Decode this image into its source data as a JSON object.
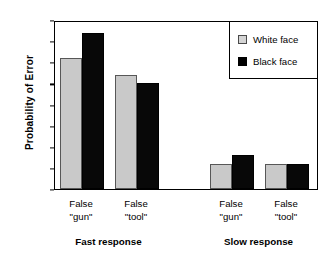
{
  "chart_data": {
    "type": "bar",
    "title": "",
    "xlabel": "",
    "ylabel": "Probability of  Error",
    "ylim": [
      0.0,
      0.4
    ],
    "yticks": [
      "0.00",
      "0.05",
      "0.10",
      "0.15",
      "0.20",
      "0.25",
      "0.30",
      "0.35",
      "0.40"
    ],
    "ytick_values": [
      0.0,
      0.05,
      0.1,
      0.15,
      0.2,
      0.25,
      0.3,
      0.35,
      0.4
    ],
    "grid": false,
    "legend_position": "top-right",
    "categories": [
      "False \"gun\"",
      "False \"tool\"",
      "False \"gun\"",
      "False \"tool\""
    ],
    "category_lines": [
      {
        "line1": "False",
        "line2": "\"gun\""
      },
      {
        "line1": "False",
        "line2": "\"tool\""
      },
      {
        "line1": "False",
        "line2": "\"gun\""
      },
      {
        "line1": "False",
        "line2": "\"tool\""
      }
    ],
    "groups": [
      {
        "label": "Fast response",
        "categories": [
          "False \"gun\"",
          "False \"tool\""
        ]
      },
      {
        "label": "Slow response",
        "categories": [
          "False \"gun\"",
          "False \"tool\""
        ]
      }
    ],
    "series": [
      {
        "name": "White face",
        "color": "#c9c9c9",
        "values": [
          0.31,
          0.27,
          0.06,
          0.06
        ]
      },
      {
        "name": "Black face",
        "color": "#000000",
        "values": [
          0.37,
          0.25,
          0.08,
          0.06
        ]
      }
    ]
  },
  "legend": {
    "items": [
      {
        "label": "White face",
        "swatch": "white"
      },
      {
        "label": "Black face",
        "swatch": "black"
      }
    ]
  },
  "axis": {
    "y_title": "Probability of  Error"
  }
}
